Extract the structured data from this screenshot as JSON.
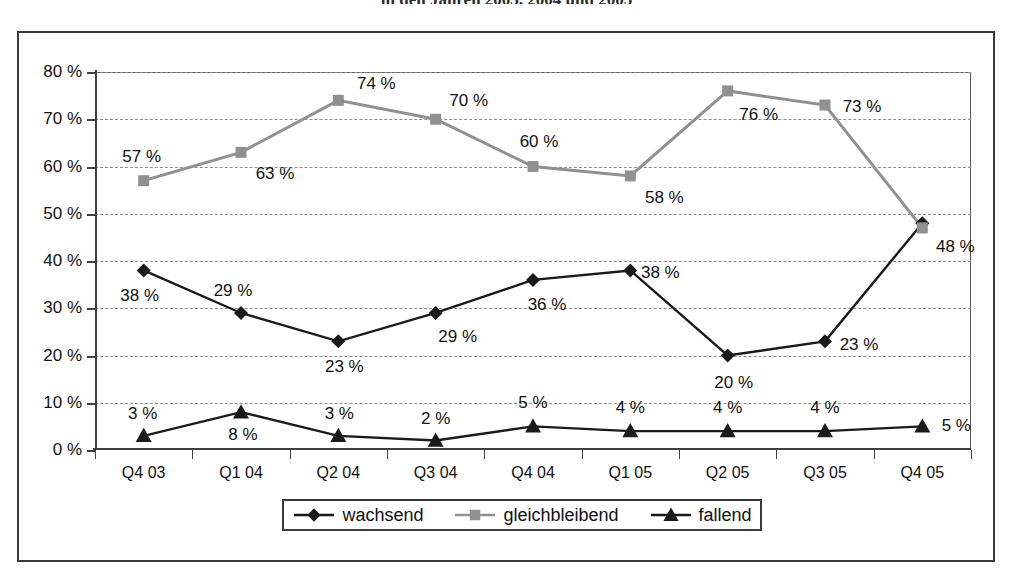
{
  "title": "in den Jahren 2003, 2004 und 2005",
  "chart_data": {
    "type": "line",
    "title": "in den Jahren 2003, 2004 und 2005",
    "xlabel": "",
    "ylabel": "",
    "ylim": [
      0,
      80
    ],
    "ytick_labels": [
      "0 %",
      "10 %",
      "20 %",
      "30 %",
      "40 %",
      "50 %",
      "60 %",
      "70 %",
      "80 %"
    ],
    "ytick_values": [
      0,
      10,
      20,
      30,
      40,
      50,
      60,
      70,
      80
    ],
    "grid": true,
    "legend_position": "bottom",
    "categories": [
      "Q4 03",
      "Q1 04",
      "Q2 04",
      "Q3 04",
      "Q4 04",
      "Q1 05",
      "Q2 05",
      "Q3 05",
      "Q4 05"
    ],
    "series": [
      {
        "name": "wachsend",
        "color": "#1a1a1a",
        "marker": "diamond",
        "values": [
          38,
          29,
          23,
          29,
          36,
          38,
          20,
          23,
          48
        ],
        "labels": [
          "38 %",
          "29 %",
          "23 %",
          "29 %",
          "36 %",
          "38 %",
          "20 %",
          "23 %",
          "48 %"
        ],
        "label_offsets": [
          {
            "dx": -4,
            "dy": 26
          },
          {
            "dx": -8,
            "dy": -22
          },
          {
            "dx": 6,
            "dy": 26
          },
          {
            "dx": 22,
            "dy": 24
          },
          {
            "dx": 14,
            "dy": 25
          },
          {
            "dx": 30,
            "dy": 3
          },
          {
            "dx": 6,
            "dy": 27
          },
          {
            "dx": 34,
            "dy": 4
          },
          {
            "dx": 33,
            "dy": 24
          }
        ]
      },
      {
        "name": "gleichbleibend",
        "color": "#909090",
        "marker": "square",
        "values": [
          57,
          63,
          74,
          70,
          60,
          58,
          76,
          73,
          47
        ],
        "labels": [
          "57 %",
          "63 %",
          "74 %",
          "70 %",
          "60 %",
          "58 %",
          "76 %",
          "73 %",
          ""
        ],
        "label_offsets": [
          {
            "dx": -2,
            "dy": -24
          },
          {
            "dx": 34,
            "dy": 22
          },
          {
            "dx": 38,
            "dy": -16
          },
          {
            "dx": 33,
            "dy": -18
          },
          {
            "dx": 6,
            "dy": -25
          },
          {
            "dx": 34,
            "dy": 22
          },
          {
            "dx": 31,
            "dy": 24
          },
          {
            "dx": 37,
            "dy": 2
          },
          {
            "dx": 0,
            "dy": 0
          }
        ]
      },
      {
        "name": "fallend",
        "color": "#1a1a1a",
        "marker": "triangle",
        "values": [
          3,
          8,
          3,
          2,
          5,
          4,
          4,
          4,
          5
        ],
        "labels": [
          "3 %",
          "8 %",
          "3 %",
          "2 %",
          "5 %",
          "4 %",
          "4 %",
          "4 %",
          "5 %"
        ],
        "label_offsets": [
          {
            "dx": -1,
            "dy": -22
          },
          {
            "dx": 2,
            "dy": 23
          },
          {
            "dx": 1,
            "dy": -22
          },
          {
            "dx": 0,
            "dy": -22
          },
          {
            "dx": 0,
            "dy": -23
          },
          {
            "dx": 0,
            "dy": -23
          },
          {
            "dx": 0,
            "dy": -23
          },
          {
            "dx": 0,
            "dy": -23
          },
          {
            "dx": 34,
            "dy": 0
          }
        ]
      }
    ]
  },
  "legend": {
    "items": [
      {
        "label": "wachsend",
        "marker": "diamond",
        "color": "#1a1a1a"
      },
      {
        "label": "gleichbleibend",
        "marker": "square",
        "color": "#909090"
      },
      {
        "label": "fallend",
        "marker": "triangle",
        "color": "#1a1a1a"
      }
    ]
  }
}
